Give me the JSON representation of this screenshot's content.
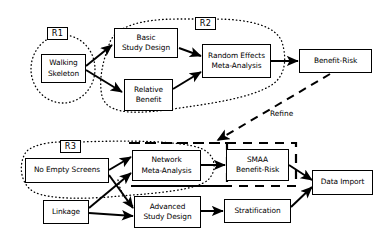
{
  "diagram": {
    "background_color": "#ffffff",
    "stroke_color": "#000000",
    "regions": [
      {
        "id": "R1",
        "label": "R1",
        "style": "dotted-ellipse"
      },
      {
        "id": "R2",
        "label": "R2",
        "style": "dotted-ellipse"
      },
      {
        "id": "R3",
        "label": "R3",
        "style": "dotted-ellipse"
      }
    ],
    "nodes": [
      {
        "id": "walking-skeleton",
        "line1": "Walking",
        "line2": "Skeleton"
      },
      {
        "id": "basic-study-design",
        "line1": "Basic",
        "line2": "Study Design"
      },
      {
        "id": "relative-benefit",
        "line1": "Relative",
        "line2": "Benefit"
      },
      {
        "id": "random-effects-meta-analysis",
        "line1": "Random Effects",
        "line2": "Meta-Analysis"
      },
      {
        "id": "benefit-risk",
        "line1": "Benefit-Risk",
        "line2": ""
      },
      {
        "id": "no-empty-screens",
        "line1": "No Empty Screens",
        "line2": ""
      },
      {
        "id": "linkage",
        "line1": "Linkage",
        "line2": ""
      },
      {
        "id": "network-meta-analysis",
        "line1": "Network",
        "line2": "Meta-Analysis"
      },
      {
        "id": "smaa-benefit-risk",
        "line1": "SMAA",
        "line2": "Benefit-Risk"
      },
      {
        "id": "advanced-study-design",
        "line1": "Advanced",
        "line2": "Study Design"
      },
      {
        "id": "stratification",
        "line1": "Stratification",
        "line2": ""
      },
      {
        "id": "data-import",
        "line1": "Data Import",
        "line2": ""
      }
    ],
    "edge_labels": [
      {
        "id": "refine",
        "text": "Refine"
      }
    ]
  }
}
